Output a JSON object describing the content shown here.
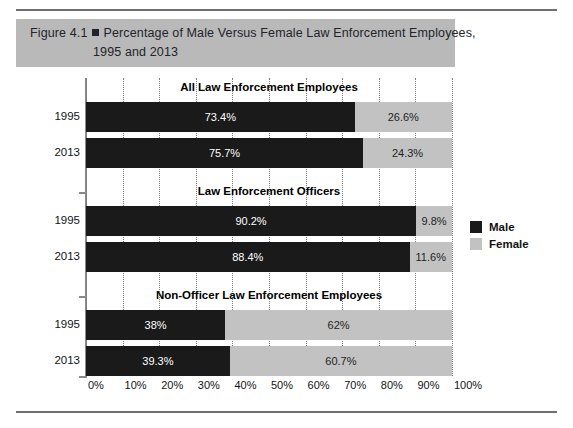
{
  "figure": {
    "number_label": "Figure 4.1",
    "marker": "square-marker",
    "title_line1": "Percentage of Male Versus Female Law Enforcement Employees,",
    "title_line2": "1995 and 2013",
    "band_color": "#b9b9b9"
  },
  "chart_data": {
    "type": "bar",
    "orientation": "horizontal",
    "stacked": true,
    "title": "Percentage of Male Versus Female Law Enforcement Employees, 1995 and 2013",
    "xlabel": "",
    "ylabel": "",
    "xlim": [
      0,
      100
    ],
    "xticks": [
      "0%",
      "10%",
      "20%",
      "30%",
      "40%",
      "50%",
      "60%",
      "70%",
      "80%",
      "90%",
      "100%"
    ],
    "grid": "vertical-dotted",
    "legend_position": "right",
    "legend": [
      {
        "name": "Male",
        "color": "#1a1a1a"
      },
      {
        "name": "Female",
        "color": "#c2c2c2"
      }
    ],
    "groups": [
      {
        "header": "All Law Enforcement Employees",
        "rows": [
          {
            "category": "1995",
            "male": 73.4,
            "female": 26.6,
            "male_label": "73.4%",
            "female_label": "26.6%"
          },
          {
            "category": "2013",
            "male": 75.7,
            "female": 24.3,
            "male_label": "75.7%",
            "female_label": "24.3%"
          }
        ]
      },
      {
        "header": "Law Enforcement Officers",
        "rows": [
          {
            "category": "1995",
            "male": 90.2,
            "female": 9.8,
            "male_label": "90.2%",
            "female_label": "9.8%"
          },
          {
            "category": "2013",
            "male": 88.4,
            "female": 11.6,
            "male_label": "88.4%",
            "female_label": "11.6%"
          }
        ]
      },
      {
        "header": "Non-Officer Law Enforcement Employees",
        "rows": [
          {
            "category": "1995",
            "male": 38,
            "female": 62,
            "male_label": "38%",
            "female_label": "62%"
          },
          {
            "category": "2013",
            "male": 39.3,
            "female": 60.7,
            "male_label": "39.3%",
            "female_label": "60.7%"
          }
        ]
      }
    ]
  }
}
